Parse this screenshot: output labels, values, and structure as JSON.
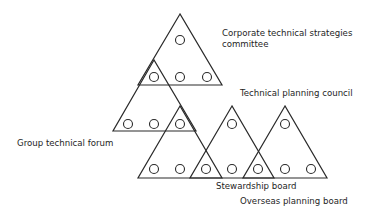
{
  "diagram": {
    "type": "overlapping-triangle-organisation",
    "stroke_color": "#2a2a2a",
    "node_radius": 4.5,
    "triangles": [
      {
        "id": "corporate-technical-strategies-committee",
        "points": [
          [
            180,
            14
          ],
          [
            138,
            85
          ],
          [
            222,
            85
          ]
        ]
      },
      {
        "id": "technical-planning-council",
        "points": [
          [
            154,
            60
          ],
          [
            113,
            131
          ],
          [
            196,
            131
          ]
        ]
      },
      {
        "id": "group-technical-forum",
        "points": [
          [
            180,
            106
          ],
          [
            138,
            178
          ],
          [
            222,
            178
          ]
        ]
      },
      {
        "id": "stewardship-board",
        "points": [
          [
            232,
            106
          ],
          [
            190,
            178
          ],
          [
            274,
            178
          ]
        ]
      },
      {
        "id": "overseas-planning-board",
        "points": [
          [
            285,
            106
          ],
          [
            243,
            178
          ],
          [
            327,
            178
          ]
        ]
      }
    ],
    "nodes": [
      [
        180,
        40
      ],
      [
        154,
        77
      ],
      [
        180,
        77
      ],
      [
        207,
        77
      ],
      [
        128,
        124
      ],
      [
        154,
        124
      ],
      [
        180,
        124
      ],
      [
        232,
        124
      ],
      [
        285,
        124
      ],
      [
        154,
        169
      ],
      [
        180,
        169
      ],
      [
        206,
        169
      ],
      [
        232,
        169
      ],
      [
        258,
        169
      ],
      [
        285,
        169
      ],
      [
        311,
        169
      ]
    ],
    "labels": {
      "corporate_line1": "Corporate technical strategies",
      "corporate_line2": "committee",
      "technical_planning": "Technical planning council",
      "group_forum": "Group technical forum",
      "stewardship": "Stewardship board",
      "overseas": "Overseas planning board"
    }
  }
}
